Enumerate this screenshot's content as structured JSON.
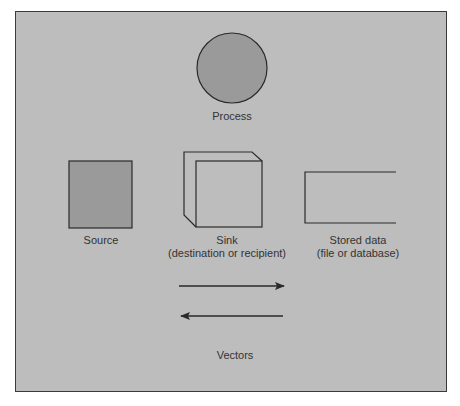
{
  "diagram": {
    "colors": {
      "background": "#bdbdbd",
      "fill_dark": "#9a9a9a",
      "stroke": "#2a2a2a",
      "text": "#333333"
    },
    "symbols": {
      "process": {
        "label": "Process"
      },
      "source": {
        "label": "Source"
      },
      "sink": {
        "label_line1": "Sink",
        "label_line2": "(destination or recipient)"
      },
      "stored_data": {
        "label_line1": "Stored data",
        "label_line2": "(file or database)"
      },
      "vectors": {
        "label": "Vectors"
      }
    }
  }
}
